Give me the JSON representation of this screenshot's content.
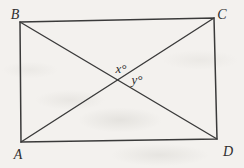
{
  "diagram": {
    "type": "geometry-figure",
    "shape": "rectangle-with-diagonals",
    "vertices": {
      "top_left": "B",
      "top_right": "C",
      "bottom_left": "A",
      "bottom_right": "D"
    },
    "angles": {
      "upper_at_intersection": "x°",
      "right_at_intersection": "y°"
    },
    "colors": {
      "line": "#3a3a3a",
      "label": "#2e2e2e",
      "background": "#f3f1ee"
    }
  }
}
